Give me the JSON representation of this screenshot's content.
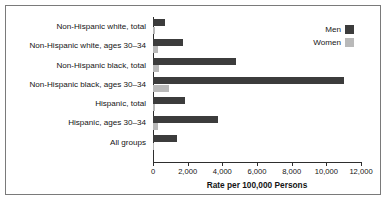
{
  "chart_data": {
    "type": "bar",
    "orientation": "horizontal",
    "title": "",
    "xlabel": "Rate per 100,000 Persons",
    "ylabel": "",
    "xlim": [
      0,
      12000
    ],
    "xticks": [
      "0",
      "2,000",
      "4,000",
      "6,000",
      "8,000",
      "10,000",
      "12,000"
    ],
    "xtick_values": [
      0,
      2000,
      4000,
      6000,
      8000,
      10000,
      12000
    ],
    "grid": false,
    "legend_position": "top-right",
    "categories": [
      "Non-Hispanic white, total",
      "Non-Hispanic white, ages 30–34",
      "Non-Hispanic black, total",
      "Non-Hispanic black, ages 30–34",
      "Hispanic, total",
      "Hispanic, ages 30–34",
      "All groups"
    ],
    "series": [
      {
        "name": "Men",
        "color": "#3c3c3c",
        "values": [
          700,
          1750,
          4800,
          11000,
          1850,
          3750,
          1400
        ]
      },
      {
        "name": "Women",
        "color": "#b9b9b9",
        "values": [
          120,
          260,
          330,
          900,
          130,
          270,
          60
        ]
      }
    ]
  },
  "legend": {
    "items": [
      {
        "label": "Men",
        "color": "#3c3c3c"
      },
      {
        "label": "Women",
        "color": "#b9b9b9"
      }
    ]
  }
}
